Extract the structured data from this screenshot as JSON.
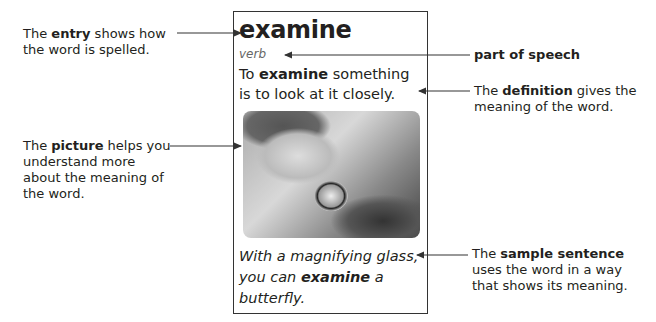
{
  "card": {
    "headword": "examine",
    "part_of_speech": "verb",
    "definition": {
      "pre": "To ",
      "bold": "examine",
      "post": " something is to look at it closely."
    },
    "picture_alt": "child looking at plants through a magnifying glass",
    "sample_sentence": {
      "pre": "With a magnifying glass, you can ",
      "bold": "examine",
      "post": " a butterfly."
    }
  },
  "callouts": {
    "entry": {
      "pre": "The ",
      "bold": "entry",
      "post": " shows how the word is spelled."
    },
    "part_of_speech": {
      "bold": "part of speech"
    },
    "definition": {
      "pre": "The ",
      "bold": "definition",
      "post": " gives the meaning of the word."
    },
    "picture": {
      "pre": "The ",
      "bold": "picture",
      "post": " helps you understand more about the meaning of the word."
    },
    "sample_sentence": {
      "pre": "The ",
      "bold": "sample sentence",
      "post": " uses the word in a way that shows its meaning."
    }
  }
}
